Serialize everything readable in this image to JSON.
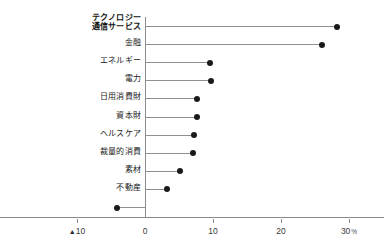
{
  "chart_data": {
    "type": "bar",
    "subtype": "lollipop-horizontal",
    "title": "",
    "xlabel": "",
    "ylabel": "",
    "unit": "%",
    "xlim": [
      -10,
      30
    ],
    "grid": false,
    "legend": null,
    "axis_ticks": [
      {
        "value": -10,
        "label": "10",
        "negative_marker": "▲"
      },
      {
        "value": 0,
        "label": "0",
        "negative_marker": ""
      },
      {
        "value": 10,
        "label": "10",
        "negative_marker": ""
      },
      {
        "value": 20,
        "label": "20",
        "negative_marker": ""
      },
      {
        "value": 30,
        "label": "30",
        "negative_marker": "",
        "unit": "%"
      }
    ],
    "categories": [
      "テクノロジー\n通信サービス",
      "金融",
      "エネルギー",
      "電力",
      "日用消費財",
      "資本財",
      "ヘルスケア",
      "裁量的消費",
      "素材",
      "不動産",
      ""
    ],
    "values": [
      28.2,
      26.1,
      9.6,
      9.7,
      7.6,
      7.6,
      7.2,
      7.0,
      5.1,
      3.3,
      -4.1
    ],
    "bold_categories": [
      0
    ],
    "colors": {
      "dot": "#1a1a1a",
      "stem": "#8f8f8f",
      "axis": "#8a8a8a",
      "text": "#232323",
      "background": "#ffffff"
    }
  }
}
